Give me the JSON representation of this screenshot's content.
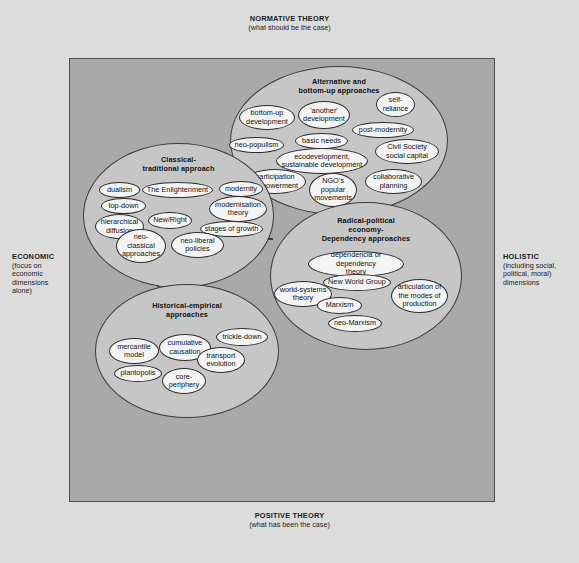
{
  "axes": {
    "top": {
      "head": "NORMATIVE\nTHEORY",
      "sub": "(what should be the case)"
    },
    "bottom": {
      "head": "POSITIVE\nTHEORY",
      "sub": "(what has been the case)"
    },
    "left": {
      "head": "ECONOMIC",
      "sub": "(focus on economic dimensions alone)"
    },
    "right": {
      "head": "HOLISTIC",
      "sub": "(including social, political, moral) dimensions"
    }
  },
  "colors": {
    "page_background": "#dcdcdc",
    "plot_background": "#a9a9a9",
    "group_fill": "#c6c6c6",
    "node_fill": "#f4f4f4",
    "outline": "#3b3b3b"
  },
  "groups": [
    {
      "id": "alternative",
      "title": "Alternative and\nbottom-up approaches",
      "nodes": [
        {
          "label": "bottom-up\ndevelopment"
        },
        {
          "label": "'another'\ndevelopment"
        },
        {
          "label": "self-\nreliance"
        },
        {
          "label": "post-modernity"
        },
        {
          "label": "basic needs"
        },
        {
          "label": "neo-populism"
        },
        {
          "label": "ecodevelopment,\nsustainable development"
        },
        {
          "label": "Civil Society\nsocial capital"
        },
        {
          "label": "participation\nempowerment"
        },
        {
          "label": "NGO's\npopular\nmovements"
        },
        {
          "label": "collaborative\nplanning"
        }
      ]
    },
    {
      "id": "classical",
      "title": "Classical-\ntraditional approach",
      "nodes": [
        {
          "label": "dualism"
        },
        {
          "label": "The Enlightenment"
        },
        {
          "label": "modernity"
        },
        {
          "label": "top-down"
        },
        {
          "label": "modernisation\ntheory"
        },
        {
          "label": "hierarchical\ndiffusion"
        },
        {
          "label": "New/Right"
        },
        {
          "label": "stages of growth"
        },
        {
          "label": "neo-\nclassical\napproaches"
        },
        {
          "label": "neo-liberal\npolicies"
        }
      ]
    },
    {
      "id": "radical",
      "title": "Radical-political\neconomy-\nDependency approaches",
      "nodes": [
        {
          "label": "dependencia or dependency\ntheory"
        },
        {
          "label": "New World Group"
        },
        {
          "label": "world-systems\ntheory"
        },
        {
          "label": "articulation of\nthe modes of\nproduction"
        },
        {
          "label": "Marxism"
        },
        {
          "label": "neo-Marxism"
        }
      ]
    },
    {
      "id": "historical",
      "title": "Historical-empirical\napproaches",
      "nodes": [
        {
          "label": "mercantile\nmodel"
        },
        {
          "label": "cumulative\ncausation"
        },
        {
          "label": "trickle-down"
        },
        {
          "label": "transport\nevolution"
        },
        {
          "label": "plantopolis"
        },
        {
          "label": "core-\nperiphery"
        }
      ]
    }
  ],
  "arrows": [
    {
      "id": "radical-to-alternative",
      "direction": "up"
    },
    {
      "id": "classical-to-radical",
      "direction": "right"
    },
    {
      "id": "radical-to-classical",
      "direction": "left"
    },
    {
      "id": "classical-to-historical",
      "direction": "down"
    }
  ]
}
